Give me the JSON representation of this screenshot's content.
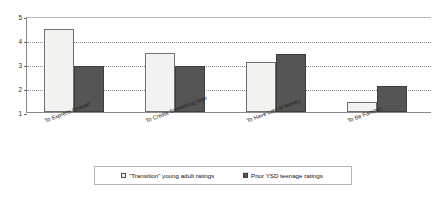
{
  "chart_data": {
    "type": "bar",
    "title": "",
    "subtitle": "",
    "xlabel": "",
    "ylabel": "",
    "ylim": [
      1,
      5
    ],
    "yticks": [
      1,
      2,
      3,
      4,
      5
    ],
    "grid": true,
    "grid_axis": "y",
    "legend_position": "bottom",
    "categories": [
      "To Express Oneself",
      "To Create Something New",
      "To Have Lots of Money",
      "To Be Famous"
    ],
    "series": [
      {
        "name": "\"Transition\" young adult ratings",
        "color": "#F2F2F0",
        "values": [
          4.45,
          3.45,
          3.1,
          1.4
        ]
      },
      {
        "name": "Prior YSD teenage ratings",
        "color": "#555555",
        "values": [
          2.9,
          2.9,
          3.4,
          2.1
        ]
      }
    ]
  },
  "axis": {
    "tick_labels": [
      "1",
      "2",
      "3",
      "4",
      "5"
    ]
  },
  "legend": {
    "entries": [
      {
        "label": "\"Transition\" young adult ratings",
        "marker": "legend-swatch-light"
      },
      {
        "label": "Prior YSD teenage ratings",
        "marker": "legend-swatch-dark"
      }
    ]
  }
}
